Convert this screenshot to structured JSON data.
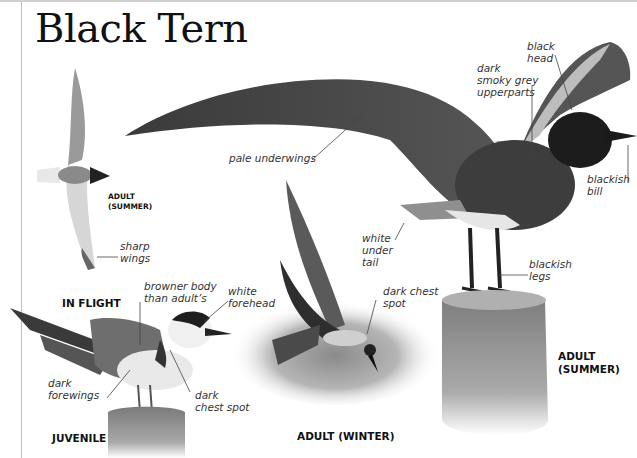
{
  "title": "Black Tern",
  "captions": {
    "in_flight_stage": "ADULT",
    "in_flight_season": "(SUMMER)",
    "in_flight": "IN FLIGHT",
    "juvenile": "JUVENILE",
    "adult_winter": "ADULT (WINTER)",
    "adult_summer_line1": "ADULT",
    "adult_summer_line2": "(SUMMER)"
  },
  "annotations": {
    "sharp_wings": [
      "sharp",
      "wings"
    ],
    "browner_body": [
      "browner body",
      "than adult’s"
    ],
    "white_forehead": [
      "white",
      "forehead"
    ],
    "dark_forewings": [
      "dark",
      "forewings"
    ],
    "juv_dark_chest_spot": [
      "dark",
      "chest spot"
    ],
    "pale_underwings": "pale underwings",
    "white_under_tail": [
      "white",
      "under",
      "tail"
    ],
    "winter_dark_chest_spot": [
      "dark chest",
      "spot"
    ],
    "dark_smoky_grey": [
      "dark",
      "smoky grey",
      "upperparts"
    ],
    "black_head": [
      "black",
      "head"
    ],
    "blackish_bill": [
      "blackish",
      "bill"
    ],
    "blackish_legs": [
      "blackish",
      "legs"
    ]
  },
  "colors": {
    "ink": "#111111",
    "label": "#333333",
    "rule": "#bdbdbd",
    "bird_dark": "#2a2a2a",
    "bird_mid": "#6b6b6b",
    "bird_light": "#d9d9d9",
    "post": "#8c8c8c"
  }
}
